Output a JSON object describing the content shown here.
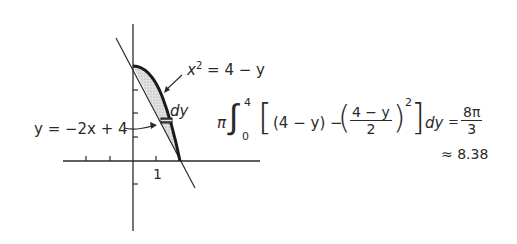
{
  "diagram": {
    "axes": {
      "x_tick_label": "1"
    },
    "labels": {
      "curve_eq_lhs": "x",
      "curve_eq_exp": "2",
      "curve_eq_rhs": "= 4 − y",
      "line_eq": "y = −2x + 4",
      "strip_label": "dy"
    },
    "integral": {
      "coef": "π",
      "upper": "4",
      "lower": "0",
      "term1": "(4 − y) −",
      "frac_num": "4 − y",
      "frac_den": "2",
      "power": "2",
      "differential": "dy",
      "equals": "=",
      "result_num": "8π",
      "result_den": "3",
      "approx": "≈ 8.38"
    },
    "colors": {
      "stroke": "#2a2a2a",
      "fill": "#d4d4d4"
    }
  }
}
